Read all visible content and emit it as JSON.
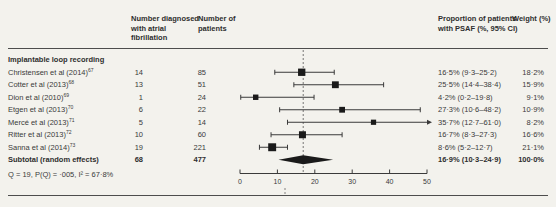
{
  "columns": {
    "diagnosed": "Number diagnosed with atrial fibrillation",
    "patients": "Number of patients",
    "proportion": "Proportion of patients with PSAF (%, 95% CI)",
    "weight": "Weight (%)"
  },
  "section": "Implantable loop recording",
  "rows": [
    {
      "study": "Christensen et al (2014)",
      "ref": "67",
      "diagnosed": "14",
      "patients": "85",
      "proportion": "16·5% (9·3–25·2)",
      "weight": "18·2%"
    },
    {
      "study": "Cotter et al (2013)",
      "ref": "68",
      "diagnosed": "13",
      "patients": "51",
      "proportion": "25·5% (14·4–38·4)",
      "weight": "15·9%"
    },
    {
      "study": "Dion et al (2010)",
      "ref": "69",
      "diagnosed": "1",
      "patients": "24",
      "proportion": "4·2% (0·2–19·8)",
      "weight": "9·1%"
    },
    {
      "study": "Etgen et al (2013)",
      "ref": "70",
      "diagnosed": "6",
      "patients": "22",
      "proportion": "27·3% (10·6–48·2)",
      "weight": "10·9%"
    },
    {
      "study": "Mercé et al (2013)",
      "ref": "71",
      "diagnosed": "5",
      "patients": "14",
      "proportion": "35·7% (12·7–61·0)",
      "weight": "8·2%"
    },
    {
      "study": "Ritter et al (2013)",
      "ref": "72",
      "diagnosed": "10",
      "patients": "60",
      "proportion": "16·7% (8·3–27·3)",
      "weight": "16·6%"
    },
    {
      "study": "Sanna et al (2014)",
      "ref": "73",
      "diagnosed": "19",
      "patients": "221",
      "proportion": "8·6% (5·2–12·7)",
      "weight": "21·1%"
    }
  ],
  "subtotal": {
    "label": "Subtotal (random effects)",
    "diagnosed": "68",
    "patients": "477",
    "proportion": "16·9% (10·3–24·9)",
    "weight": "100·0%"
  },
  "heterogeneity": "Q = 19, P(Q) = ·005, I² = 67·8%",
  "chart_data": {
    "type": "scatter",
    "subtype": "forest-plot",
    "xlabel": "",
    "xlim": [
      0,
      50
    ],
    "x_ticks": [
      0,
      10,
      20,
      30,
      40,
      50
    ],
    "reference_line": 16.9,
    "marker_color": "#1a1a1a",
    "studies": [
      {
        "name": "Christensen et al (2014)",
        "est": 16.5,
        "lo": 9.3,
        "hi": 25.2,
        "weight": 18.2
      },
      {
        "name": "Cotter et al (2013)",
        "est": 25.5,
        "lo": 14.4,
        "hi": 38.4,
        "weight": 15.9
      },
      {
        "name": "Dion et al (2010)",
        "est": 4.2,
        "lo": 0.2,
        "hi": 19.8,
        "weight": 9.1
      },
      {
        "name": "Etgen et al (2013)",
        "est": 27.3,
        "lo": 10.6,
        "hi": 48.2,
        "weight": 10.9
      },
      {
        "name": "Mercé et al (2013)",
        "est": 35.7,
        "lo": 12.7,
        "hi": 61.0,
        "weight": 8.2
      },
      {
        "name": "Ritter et al (2013)",
        "est": 16.7,
        "lo": 8.3,
        "hi": 27.3,
        "weight": 16.6
      },
      {
        "name": "Sanna et al (2014)",
        "est": 8.6,
        "lo": 5.2,
        "hi": 12.7,
        "weight": 21.1
      }
    ],
    "pooled": {
      "name": "Subtotal (random effects)",
      "est": 16.9,
      "lo": 10.3,
      "hi": 24.9,
      "weight": 100.0
    }
  }
}
